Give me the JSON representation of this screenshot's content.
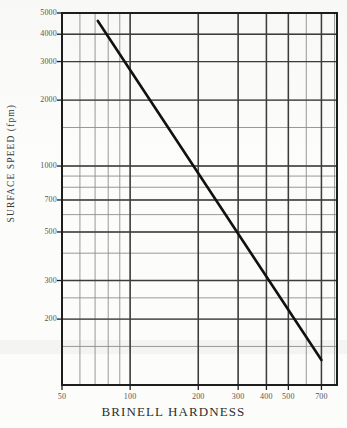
{
  "chart_data": {
    "type": "line",
    "title": "",
    "xlabel": "BRINELL  HARDNESS",
    "ylabel": "SURFACE SPEED  (fpm)",
    "xscale": "log",
    "yscale": "log",
    "xlim": [
      50,
      820
    ],
    "ylim": [
      100,
      5000
    ],
    "grid": true,
    "legend": false,
    "legend_position": "none",
    "xtick_labels": [
      "50",
      "100",
      "200",
      "300",
      "400",
      "500",
      "700"
    ],
    "xtick_values": [
      50,
      100,
      200,
      300,
      400,
      500,
      700
    ],
    "ytick_labels": [
      "5000",
      "4000",
      "3000",
      "2000",
      "1000",
      "700",
      "500",
      "300",
      "200"
    ],
    "ytick_values": [
      5000,
      4000,
      3000,
      2000,
      1000,
      700,
      500,
      300,
      200
    ],
    "x_minor_gridlines": [
      60,
      70,
      80,
      90,
      100,
      200,
      300,
      400,
      500,
      600,
      700,
      800
    ],
    "y_minor_gridlines": [
      150,
      200,
      250,
      300,
      400,
      500,
      600,
      700,
      800,
      900,
      1000,
      1500,
      2000,
      3000,
      4000,
      5000
    ],
    "series": [
      {
        "name": "surface-speed-vs-brinell-hardness",
        "color": "#111111",
        "linewidth": 2.6,
        "x": [
          72,
          700
        ],
        "y": [
          4600,
          130
        ]
      }
    ]
  },
  "axis_titles": {
    "x": "BRINELL  HARDNESS",
    "y": "SURFACE SPEED  (fpm)"
  },
  "colors": {
    "line": "#111111",
    "grid_major": "#3c3c3c",
    "grid_minor": "#8d8d8d",
    "frame": "#1d1d1d",
    "background": "#fcfcfa",
    "tick_text": "#555555"
  }
}
